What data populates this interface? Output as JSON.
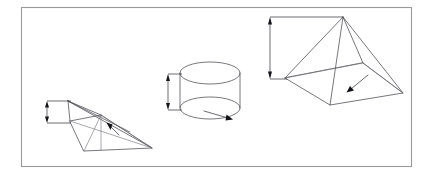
{
  "figure": {
    "canvas": {
      "width": 432,
      "height": 177
    },
    "background_color": "#ffffff",
    "frame": {
      "name": "figure-border",
      "x": 21,
      "y": 7,
      "width": 391,
      "height": 160,
      "stroke_color": "#9a9a9a"
    },
    "stroke_colors": {
      "solid_edge": "#4a4a50",
      "hidden_edge": "#6e6e76",
      "dimension": "#2b2b30",
      "leader": "#3a3a42",
      "arrowhead": "#111116"
    },
    "shapes": [
      {
        "id": "left-pyramid",
        "label": "pyramid-low-angle",
        "kind": "pyramid",
        "apex": [
          68,
          101
        ],
        "base": [
          [
            70,
            121
          ],
          [
            101,
            115
          ],
          [
            152,
            148
          ],
          [
            84,
            151
          ]
        ],
        "internal_vertex": [
          101,
          115
        ],
        "dimension": {
          "name": "left-pyramid-height-dimension",
          "orientation": "vertical",
          "x": 47,
          "y_top": 101,
          "y_bottom": 123,
          "ext_top_to_x": 70,
          "ext_bottom_to_x": 70,
          "double_headed": true
        },
        "leader": {
          "name": "left-pyramid-leader-arrow",
          "from": [
            118,
            134
          ],
          "to": [
            107,
            124
          ],
          "direction": "up-right"
        }
      },
      {
        "id": "center-cylinder",
        "label": "cylinder",
        "kind": "cylinder",
        "center_x": 210,
        "radius_x": 30,
        "radius_y": 11,
        "top_cy": 73,
        "bottom_cy": 108,
        "dimension": {
          "name": "cylinder-height-dimension",
          "orientation": "vertical",
          "x": 168,
          "y_top": 74,
          "y_bottom": 110,
          "ext_top_to_x": 182,
          "ext_bottom_to_x": 182,
          "double_headed": true
        },
        "leader": {
          "name": "cylinder-leader-arrow",
          "from": [
            205,
            112
          ],
          "to": [
            232,
            120
          ],
          "direction": "down-right"
        }
      },
      {
        "id": "right-pyramid",
        "label": "pyramid-square-base",
        "kind": "pyramid",
        "apex": [
          343,
          17
        ],
        "base": [
          [
            285,
            78
          ],
          [
            330,
            105
          ],
          [
            403,
            93
          ],
          [
            363,
            63
          ]
        ],
        "dimension": {
          "name": "right-pyramid-height-dimension",
          "orientation": "vertical",
          "x": 270,
          "y_top": 17,
          "y_bottom": 79,
          "ext_top_to_x": 343,
          "ext_bottom_to_x": 285,
          "double_headed": true
        },
        "leader": {
          "name": "right-pyramid-leader-arrow",
          "from": [
            367,
            76
          ],
          "to": [
            347,
            92
          ],
          "direction": "down-left"
        }
      }
    ]
  }
}
